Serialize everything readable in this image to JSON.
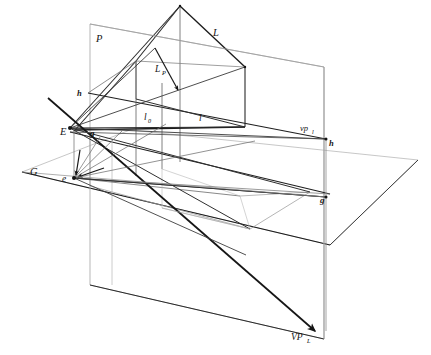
{
  "figure": {
    "type": "technical-line-diagram",
    "background_color": "#ffffff",
    "line_color": "#141414",
    "faint_line_color": "#9a9a9a",
    "width": 431,
    "height": 355
  },
  "labels": {
    "picture_plane": "P",
    "ground_plane": "G",
    "eye_point": "E",
    "eye_ground": "e",
    "ground_line_left": "g",
    "ground_line_right": "g",
    "horizon_left": "h",
    "horizon_right": "h",
    "line_L": "L",
    "line_LP": "L",
    "line_LP_sub": "P",
    "line_l0": "l",
    "line_l0_sub": "0",
    "line_l": "l",
    "vanishing_point_l": "vp",
    "vanishing_point_l_sub": "l",
    "vanishing_point_L": "VP",
    "vanishing_point_L_sub": "L"
  },
  "geometry": {
    "picture_plane_quad": "90,24 324,67 324,339 90,285",
    "ground_plane_quad": "22,172 130,130 418,160 330,245",
    "eye_point": "70,128",
    "eye_ground_point": "74,178",
    "vp_l_point": "326,139",
    "vp_L_point": "315,331",
    "house_apex": "180,6",
    "house_left_gable": "136,61",
    "house_right_gable": "245,67",
    "ground_front_left": "75,130",
    "ground_front_right": "246,127",
    "horizon_y_left": 93,
    "horizon_y_right": 143
  },
  "colors": {
    "stroke_strong": "#141414",
    "stroke_mid": "#3a3a3a",
    "stroke_faint": "#9d9d9d",
    "stroke_very_faint": "#bdbdbd"
  }
}
